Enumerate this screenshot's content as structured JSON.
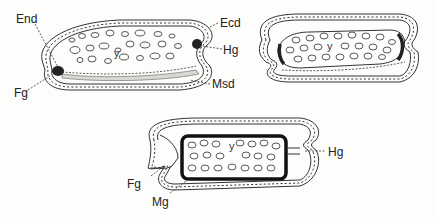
{
  "figure": {
    "panels": [
      {
        "id": "stage-1",
        "yolk_label": "y",
        "labels": [
          "End",
          "Ecd",
          "Hg",
          "Fg",
          "Msd"
        ]
      },
      {
        "id": "stage-2",
        "yolk_label": "y",
        "labels": []
      },
      {
        "id": "stage-3",
        "yolk_label": "y",
        "labels": [
          "Hg",
          "Fg",
          "Mg"
        ]
      }
    ],
    "labels": {
      "end": "End",
      "ecd": "Ecd",
      "hg1": "Hg",
      "fg1": "Fg",
      "msd": "Msd",
      "hg3": "Hg",
      "fg3": "Fg",
      "mg": "Mg",
      "y1": "y",
      "y2": "y",
      "y3": "y"
    },
    "colors": {
      "ink": "#222222",
      "paper": "#fdfdfb",
      "mesoderm_fill": "#d8d8d4"
    }
  }
}
